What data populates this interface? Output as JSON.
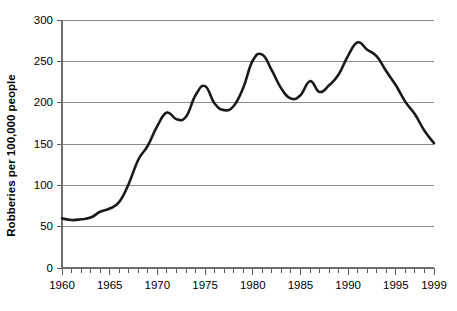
{
  "chart_data": {
    "type": "line",
    "title": "",
    "xlabel": "",
    "ylabel": "Robberies per 100,000 people",
    "xlim": [
      1960,
      1999
    ],
    "ylim": [
      0,
      300
    ],
    "y_ticks": [
      0,
      50,
      100,
      150,
      200,
      250,
      300
    ],
    "x_ticks": [
      1960,
      1965,
      1970,
      1975,
      1980,
      1985,
      1990,
      1995,
      1999
    ],
    "x_tick_labels": [
      "1960",
      "1965",
      "1970",
      "1975",
      "1980",
      "1985",
      "1990",
      "1995",
      "1999"
    ],
    "y_tick_labels": [
      "0",
      "50",
      "100",
      "150",
      "200",
      "250",
      "300"
    ],
    "grid": "horizontal",
    "legend": "none",
    "line_color": "#1a1a1a",
    "grid_color": "#8c8c8c",
    "x": [
      1960,
      1961,
      1962,
      1963,
      1964,
      1965,
      1966,
      1967,
      1968,
      1969,
      1970,
      1971,
      1972,
      1973,
      1974,
      1975,
      1976,
      1977,
      1978,
      1979,
      1980,
      1981,
      1982,
      1983,
      1984,
      1985,
      1986,
      1987,
      1988,
      1989,
      1990,
      1991,
      1992,
      1993,
      1994,
      1995,
      1996,
      1997,
      1998,
      1999
    ],
    "values": [
      60,
      58,
      59,
      61,
      68,
      72,
      80,
      102,
      131,
      148,
      172,
      188,
      180,
      183,
      209,
      220,
      199,
      191,
      196,
      218,
      251,
      258,
      239,
      217,
      205,
      209,
      226,
      213,
      221,
      234,
      257,
      273,
      264,
      256,
      238,
      221,
      201,
      186,
      166,
      151
    ]
  }
}
